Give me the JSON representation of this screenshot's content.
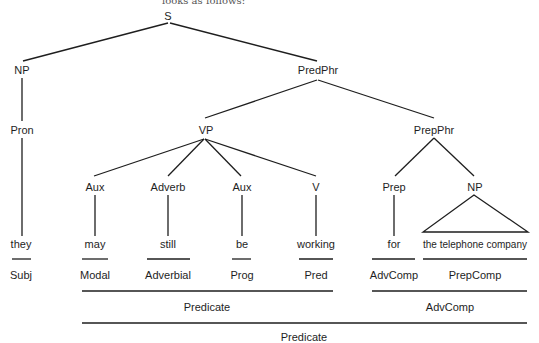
{
  "caption_fragment": "looks as follows:",
  "tree": {
    "root": "S",
    "nodes": {
      "s": "S",
      "np_subj": "NP",
      "pron": "Pron",
      "predphr": "PredPhr",
      "vp": "VP",
      "prepphr": "PrepPhr",
      "aux1": "Aux",
      "adverb": "Adverb",
      "aux2": "Aux",
      "v": "V",
      "prep": "Prep",
      "np_obj": "NP"
    },
    "words": {
      "they": "they",
      "may": "may",
      "still": "still",
      "be": "be",
      "working": "working",
      "for": "for",
      "the_telephone_company": "the telephone company"
    }
  },
  "functions": {
    "subj": "Subj",
    "modal": "Modal",
    "adverbial": "Adverbial",
    "prog": "Prog",
    "pred": "Pred",
    "advcomp_for": "AdvComp",
    "prepcomp": "PrepComp",
    "predicate_inner": "Predicate",
    "advcomp_phrase": "AdvComp",
    "predicate_outer": "Predicate"
  }
}
